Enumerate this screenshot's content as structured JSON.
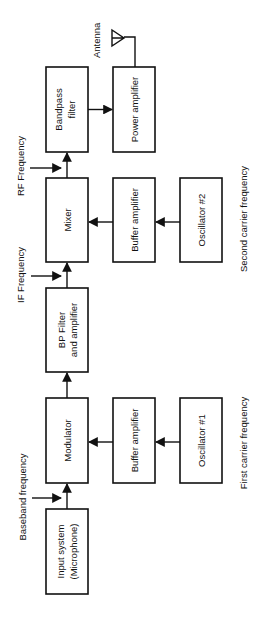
{
  "diagram": {
    "type": "block-diagram",
    "orientation": "rotated-90-ccw",
    "blocks": {
      "bandpass_filter": [
        "Bandpass",
        "filter"
      ],
      "power_amplifier": [
        "Power amplifier"
      ],
      "mixer": [
        "Mixer"
      ],
      "buffer_amplifier_2": [
        "Buffer amplifier"
      ],
      "oscillator_2": [
        "Oscillator #2"
      ],
      "bp_filter_amp": [
        "BP Filter",
        "and amplifier"
      ],
      "modulator": [
        "Modulator"
      ],
      "buffer_amplifier_1": [
        "Buffer amplifier"
      ],
      "oscillator_1": [
        "Oscillator #1"
      ],
      "input_system": [
        "Input system",
        "(Microphone)"
      ]
    },
    "labels": {
      "antenna": "Antenna",
      "rf_frequency": "RF Frequency",
      "if_frequency": "IF Frequency",
      "baseband_frequency": "Baseband frequency",
      "second_carrier": "Second carrier frequency",
      "first_carrier": "First carrier frequency"
    },
    "connections": [
      [
        "input_system",
        "modulator"
      ],
      [
        "oscillator_1",
        "buffer_amplifier_1"
      ],
      [
        "buffer_amplifier_1",
        "modulator"
      ],
      [
        "modulator",
        "bp_filter_amp"
      ],
      [
        "bp_filter_amp",
        "mixer"
      ],
      [
        "oscillator_2",
        "buffer_amplifier_2"
      ],
      [
        "buffer_amplifier_2",
        "mixer"
      ],
      [
        "mixer",
        "bandpass_filter"
      ],
      [
        "bandpass_filter",
        "power_amplifier"
      ],
      [
        "power_amplifier",
        "antenna"
      ]
    ]
  }
}
